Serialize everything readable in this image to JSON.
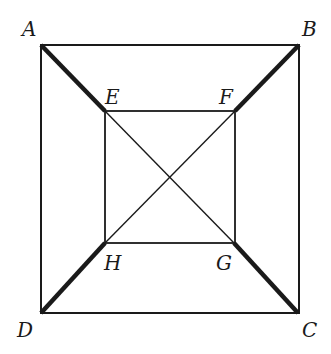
{
  "diagram": {
    "type": "geometry",
    "points": {
      "A": {
        "label": "A",
        "x": 41,
        "y": 45
      },
      "B": {
        "label": "B",
        "x": 299,
        "y": 45
      },
      "C": {
        "label": "C",
        "x": 298,
        "y": 313
      },
      "D": {
        "label": "D",
        "x": 41,
        "y": 313
      },
      "E": {
        "label": "E",
        "x": 105,
        "y": 111
      },
      "F": {
        "label": "F",
        "x": 235,
        "y": 111
      },
      "G": {
        "label": "G",
        "x": 234,
        "y": 243
      },
      "H": {
        "label": "H",
        "x": 105,
        "y": 243
      }
    },
    "outer_square": [
      "A",
      "B",
      "C",
      "D"
    ],
    "inner_square": [
      "E",
      "F",
      "G",
      "H"
    ],
    "thin_segments": [
      [
        "E",
        "G"
      ],
      [
        "F",
        "H"
      ]
    ],
    "thick_segments": [
      [
        "A",
        "E"
      ],
      [
        "B",
        "F"
      ],
      [
        "G",
        "C"
      ],
      [
        "H",
        "D"
      ]
    ],
    "colors": {
      "line": "#1a1a1a",
      "background": "#ffffff"
    }
  }
}
